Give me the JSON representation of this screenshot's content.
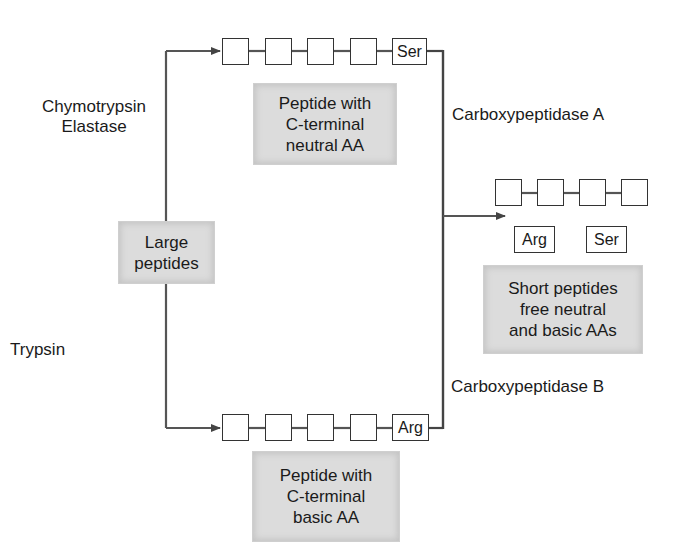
{
  "diagram": {
    "source_node": {
      "line1": "Large",
      "line2": "peptides"
    },
    "enzymes": {
      "top_left": {
        "line1": "Chymotrypsin",
        "line2": "Elastase"
      },
      "bottom_left": "Trypsin",
      "top_right": "Carboxypeptidase A",
      "bottom_right": "Carboxypeptidase B"
    },
    "top_chain": {
      "residues": [
        "",
        "",
        "",
        "",
        "Ser"
      ],
      "description": {
        "line1": "Peptide with",
        "line2": "C-terminal",
        "line3": "neutral AA"
      }
    },
    "bottom_chain": {
      "residues": [
        "",
        "",
        "",
        "",
        "Arg"
      ],
      "description": {
        "line1": "Peptide with",
        "line2": "C-terminal",
        "line3": "basic AA"
      }
    },
    "products": {
      "chain_residues": [
        "",
        "",
        "",
        ""
      ],
      "free_amino_acids": [
        "Arg",
        "Ser"
      ],
      "description": {
        "line1": "Short peptides",
        "line2": "free neutral",
        "line3": "and basic AAs"
      }
    },
    "colors": {
      "line": "#444444",
      "box_fill": "#dcdcdc",
      "residue_border": "#333333"
    }
  }
}
